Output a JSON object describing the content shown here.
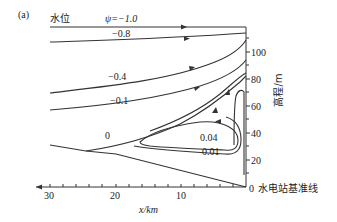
{
  "panel_label": "(a)",
  "water_level_label": "水位",
  "psi_label": "ψ=−1.0",
  "contours": {
    "c_m08": "−0.8",
    "c_m04": "−0.4",
    "c_m01": "−0.1",
    "c_0": "0",
    "c_004": "0.04",
    "c_001": "0.01"
  },
  "x_axis": {
    "label": "x/km",
    "ticks": [
      "30",
      "20",
      "10",
      "0"
    ]
  },
  "y_axis": {
    "label": "高程/m",
    "ticks": [
      "20",
      "40",
      "60",
      "80",
      "100"
    ]
  },
  "baseline_label": "水电站基准线",
  "colors": {
    "line": "#333333",
    "text": "#222222",
    "background": "#ffffff"
  }
}
